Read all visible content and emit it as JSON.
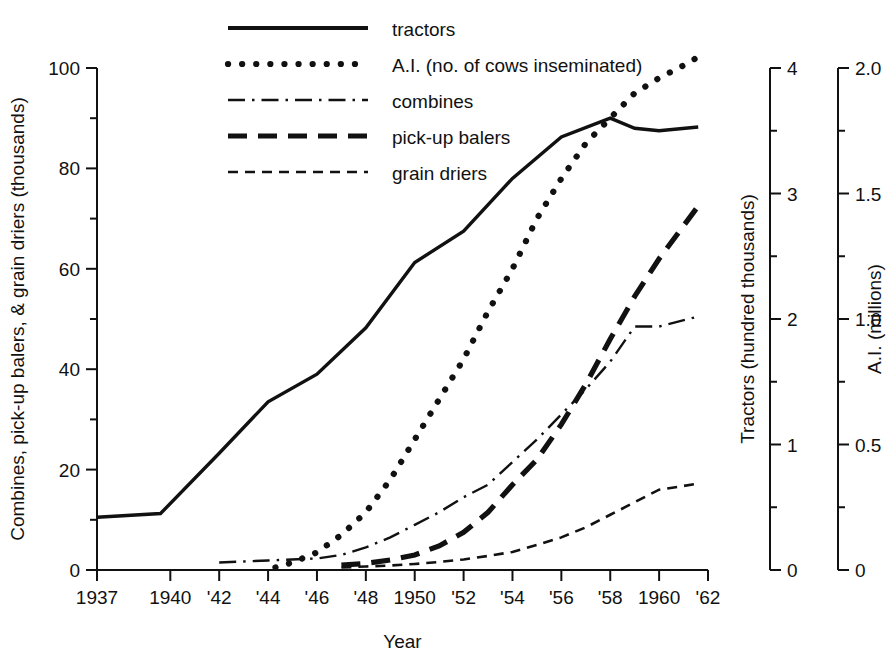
{
  "chart_data": {
    "type": "line",
    "title": "",
    "xlabel": "Year",
    "grid": false,
    "legend_position": "top-center",
    "x_tick_labels": [
      "1937",
      "1940",
      "'42",
      "'44",
      "'46",
      "'48",
      "1950",
      "'52",
      "'54",
      "'56",
      "'58",
      "1960",
      "'62"
    ],
    "x_tick_years": [
      1937,
      1940,
      1942,
      1944,
      1946,
      1948,
      1950,
      1952,
      1954,
      1956,
      1958,
      1960,
      1962
    ],
    "xlim": [
      1937,
      1962
    ],
    "axes": [
      {
        "id": "left",
        "label": "Combines, pick-up balers, & grain driers  (thousands)",
        "ticks": [
          0,
          20,
          40,
          60,
          80,
          100
        ],
        "minor_ticks": [
          10,
          30,
          50,
          70,
          90
        ],
        "tick_labels": [
          "0",
          "20",
          "40",
          "60",
          "80",
          "100"
        ],
        "range": [
          0,
          100
        ]
      },
      {
        "id": "right-tractors",
        "label": "Tractors  (hundred thousands)",
        "ticks": [
          0,
          1,
          2,
          3,
          4
        ],
        "minor_ticks": [
          0.5,
          1.5,
          2.5,
          3.5
        ],
        "tick_labels": [
          "0",
          "1",
          "2",
          "3",
          "4"
        ],
        "range": [
          0,
          4
        ]
      },
      {
        "id": "right-ai",
        "label": "A.I.  (millions)",
        "ticks": [
          0,
          0.5,
          1.0,
          1.5,
          2.0
        ],
        "minor_ticks": [
          0.25,
          0.75,
          1.25,
          1.75
        ],
        "tick_labels": [
          "0",
          "0.5",
          "1.0",
          "1.5",
          "2.0"
        ],
        "range": [
          0,
          2.0
        ]
      }
    ],
    "legend": [
      {
        "key": "tractors",
        "label": "tractors",
        "style": "solid"
      },
      {
        "key": "ai",
        "label": "A.I. (no. of cows inseminated)",
        "style": "dotted"
      },
      {
        "key": "combines",
        "label": "combines",
        "style": "dash-dot"
      },
      {
        "key": "balers",
        "label": "pick-up balers",
        "style": "dashed-thick"
      },
      {
        "key": "driers",
        "label": "grain driers",
        "style": "dashed-thin"
      }
    ],
    "series": [
      {
        "name": "tractors",
        "axis": "right-tractors",
        "unit": "hundred thousands",
        "x": [
          1937,
          1939.6,
          1942,
          1944,
          1946,
          1948,
          1950,
          1952,
          1954,
          1956,
          1958,
          1959,
          1960,
          1961.6
        ],
        "values": [
          0.42,
          0.45,
          0.93,
          1.34,
          1.56,
          1.93,
          2.45,
          2.7,
          3.12,
          3.45,
          3.6,
          3.52,
          3.5,
          3.53
        ],
        "values_left_scale": [
          10.5,
          11.3,
          23.2,
          33.5,
          39.0,
          48.2,
          61.2,
          67.5,
          78.0,
          86.2,
          90.0,
          88.0,
          87.5,
          88.2
        ]
      },
      {
        "name": "A.I. (no. of cows inseminated)",
        "axis": "right-ai",
        "unit": "millions",
        "x": [
          1944.3,
          1945,
          1946,
          1947,
          1948,
          1949,
          1950,
          1951,
          1952,
          1953,
          1954,
          1955,
          1956,
          1957,
          1958,
          1959,
          1960,
          1961,
          1961.7
        ],
        "values": [
          0.01,
          0.03,
          0.07,
          0.14,
          0.23,
          0.36,
          0.52,
          0.68,
          0.84,
          1.03,
          1.2,
          1.4,
          1.56,
          1.7,
          1.8,
          1.9,
          1.96,
          2.01,
          2.05
        ],
        "values_left_scale": [
          0.5,
          1.5,
          3.5,
          7.0,
          11.5,
          18.0,
          26.0,
          34.0,
          42.0,
          51.5,
          60.0,
          70.0,
          78.0,
          85.0,
          90.0,
          95.0,
          98.0,
          100.5,
          102.5
        ]
      },
      {
        "name": "combines",
        "axis": "left",
        "unit": "thousands",
        "x": [
          1942,
          1944,
          1946,
          1947,
          1948,
          1949,
          1950,
          1951,
          1952,
          1953,
          1954,
          1955,
          1956,
          1957,
          1958,
          1959,
          1960,
          1961.6
        ],
        "values": [
          1.5,
          1.9,
          2.3,
          3.0,
          4.5,
          6.5,
          9.0,
          11.5,
          14.5,
          17.0,
          21.5,
          26.0,
          31.0,
          36.0,
          41.5,
          48.5,
          48.5,
          50.5
        ]
      },
      {
        "name": "pick-up balers",
        "axis": "left",
        "unit": "thousands",
        "x": [
          1947,
          1948,
          1949,
          1950,
          1951,
          1952,
          1953,
          1954,
          1955,
          1956,
          1957,
          1958,
          1959,
          1960,
          1961.6
        ],
        "values": [
          1.0,
          1.3,
          2.0,
          3.0,
          4.8,
          7.5,
          11.5,
          17.0,
          22.0,
          29.0,
          37.0,
          46.0,
          54.5,
          62.0,
          72.5
        ]
      },
      {
        "name": "grain driers",
        "axis": "left",
        "unit": "thousands",
        "x": [
          1947,
          1948,
          1949,
          1950,
          1951,
          1952,
          1953,
          1954,
          1955,
          1956,
          1957,
          1958,
          1959,
          1960,
          1961.6
        ],
        "values": [
          0.5,
          0.7,
          0.9,
          1.2,
          1.6,
          2.1,
          2.8,
          3.6,
          5.0,
          6.5,
          8.5,
          11.0,
          13.5,
          16.0,
          17.2
        ]
      }
    ]
  }
}
